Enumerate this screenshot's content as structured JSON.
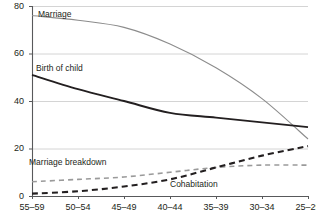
{
  "chart_data": {
    "type": "line",
    "title": "",
    "subtitle": "",
    "xlabel": "",
    "ylabel": "",
    "categories": [
      "55–59",
      "50–54",
      "45–49",
      "40–44",
      "35–39",
      "30–34",
      "25–29"
    ],
    "x_tick_labels": [
      "55–59",
      "50–54",
      "45–49",
      "40–44",
      "35–39",
      "30–34",
      "25–29"
    ],
    "y_tick_labels": [
      "0",
      "20",
      "40",
      "60",
      "80"
    ],
    "y_ticks": [
      0,
      20,
      40,
      60,
      80
    ],
    "ylim": [
      0,
      80
    ],
    "xlim_categories": 7,
    "grid": "horizontal",
    "legend_position": "inline-annotations",
    "series": [
      {
        "name": "Marriage",
        "label": "Marriage",
        "color": "#8c8c8c",
        "style": "solid",
        "width": 1.1,
        "values": [
          76,
          74,
          71,
          64,
          54,
          41,
          24
        ],
        "label_x": 38,
        "label_y": 10
      },
      {
        "name": "Birth of child",
        "label": "Birth of child",
        "color": "#231f20",
        "style": "solid",
        "width": 1.9,
        "values": [
          51,
          45,
          40,
          35,
          33,
          31,
          29
        ],
        "label_x": 36,
        "label_y": 64
      },
      {
        "name": "Marriage breakdown",
        "label": "Marriage breakdown",
        "color": "#9a9a9a",
        "style": "dashed",
        "width": 1.6,
        "values": [
          6,
          7,
          8,
          10,
          12,
          13,
          13
        ],
        "label_x": 29,
        "label_y": 158
      },
      {
        "name": "Cohabitation",
        "label": "Cohabitation",
        "color": "#231f20",
        "style": "dashed",
        "width": 2.1,
        "values": [
          1,
          2,
          4,
          7,
          12,
          17,
          21
        ],
        "label_x": 170,
        "label_y": 180
      }
    ],
    "colors": {
      "axis": "#58595b",
      "grid": "#d4d4d4",
      "text": "#231f20",
      "background": "#ffffff",
      "marriage": "#8c8c8c",
      "birth_of_child": "#231f20",
      "marriage_breakdown": "#9a9a9a",
      "cohabitation": "#231f20"
    },
    "geometry": {
      "plot_left": 32,
      "plot_right": 308,
      "plot_top": 6,
      "plot_bottom": 196
    }
  }
}
